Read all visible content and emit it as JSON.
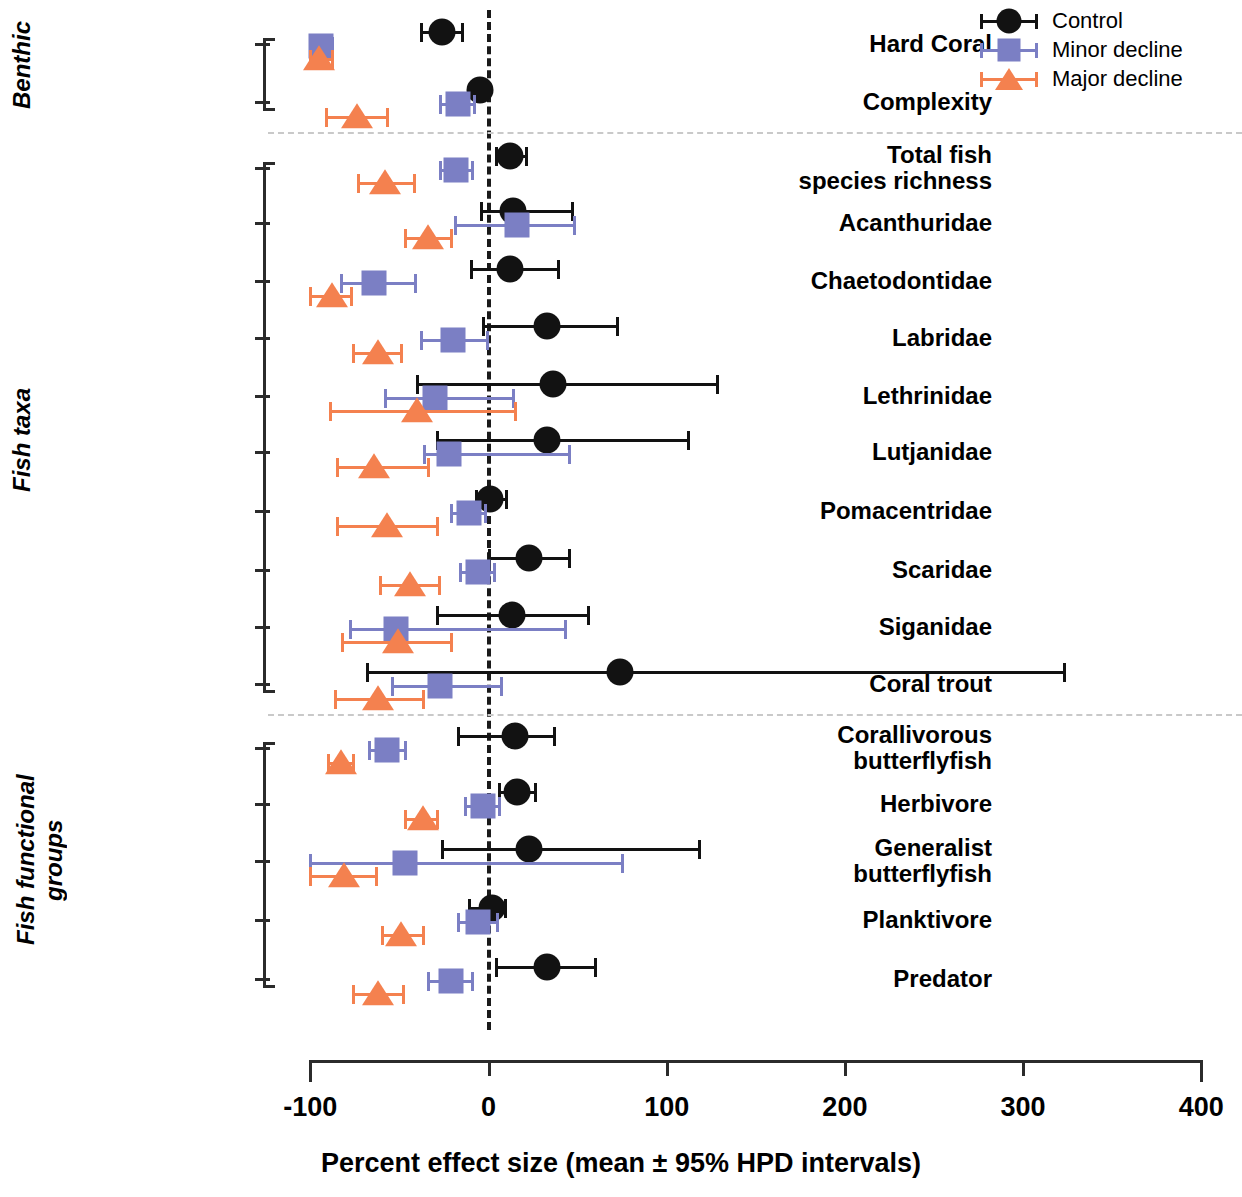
{
  "legend": {
    "items": [
      {
        "label": "Control",
        "marker": "circle",
        "color": "#121212"
      },
      {
        "label": "Minor decline",
        "marker": "square",
        "color": "#7b7fc4"
      },
      {
        "label": "Major decline",
        "marker": "triangle",
        "color": "#f4814f"
      }
    ]
  },
  "axis": {
    "xlabel": "Percent effect size (mean ± 95% HPD intervals)",
    "xticks": [
      "-100",
      "0",
      "100",
      "200",
      "300",
      "400"
    ]
  },
  "groups": [
    {
      "label": "Benthic"
    },
    {
      "label": "Fish taxa"
    },
    {
      "label": "Fish functional\ngroups"
    }
  ],
  "rows": [
    {
      "label": "Hard Coral"
    },
    {
      "label": "Complexity"
    },
    {
      "label": "Total fish\nspecies richness"
    },
    {
      "label": "Acanthuridae"
    },
    {
      "label": "Chaetodontidae"
    },
    {
      "label": "Labridae"
    },
    {
      "label": "Lethrinidae"
    },
    {
      "label": "Lutjanidae"
    },
    {
      "label": "Pomacentridae"
    },
    {
      "label": "Scaridae"
    },
    {
      "label": "Siganidae"
    },
    {
      "label": "Coral trout"
    },
    {
      "label": "Corallivorous\nbutterflyfish"
    },
    {
      "label": "Herbivore"
    },
    {
      "label": "Generalist\nbutterflyfish"
    },
    {
      "label": "Planktivore"
    },
    {
      "label": "Predator"
    }
  ],
  "chart_data": {
    "type": "scatter",
    "subtype": "forest-plot",
    "title": "",
    "xlabel": "Percent effect size (mean ± 95% HPD intervals)",
    "ylabel": "",
    "xlim": [
      -100,
      400
    ],
    "xticks": [
      -100,
      0,
      100,
      200,
      300,
      400
    ],
    "grid": false,
    "reference_line": 0,
    "legend_position": "top-right",
    "categories": [
      "Hard Coral",
      "Complexity",
      "Total fish species richness",
      "Acanthuridae",
      "Chaetodontidae",
      "Labridae",
      "Lethrinidae",
      "Lutjanidae",
      "Pomacentridae",
      "Scaridae",
      "Siganidae",
      "Coral trout",
      "Corallivorous butterflyfish",
      "Herbivore",
      "Generalist butterflyfish",
      "Planktivore",
      "Predator"
    ],
    "category_groups": [
      {
        "name": "Benthic",
        "categories": [
          "Hard Coral",
          "Complexity"
        ]
      },
      {
        "name": "Fish taxa",
        "categories": [
          "Total fish species richness",
          "Acanthuridae",
          "Chaetodontidae",
          "Labridae",
          "Lethrinidae",
          "Lutjanidae",
          "Pomacentridae",
          "Scaridae",
          "Siganidae",
          "Coral trout"
        ]
      },
      {
        "name": "Fish functional groups",
        "categories": [
          "Corallivorous butterflyfish",
          "Herbivore",
          "Generalist butterflyfish",
          "Planktivore",
          "Predator"
        ]
      }
    ],
    "series": [
      {
        "name": "Control",
        "marker": "circle",
        "color": "#121212",
        "values": [
          -26,
          -5,
          12,
          14,
          12,
          33,
          36,
          33,
          1,
          23,
          13,
          74,
          15,
          16,
          23,
          2,
          33
        ],
        "ci_lower": [
          -38,
          -9,
          4,
          -4,
          -10,
          -3,
          -40,
          -29,
          -7,
          0,
          -29,
          -68,
          -17,
          6,
          -26,
          -11,
          4
        ],
        "ci_upper": [
          -15,
          -2,
          21,
          47,
          39,
          72,
          128,
          112,
          10,
          45,
          56,
          323,
          37,
          26,
          118,
          9,
          60
        ]
      },
      {
        "name": "Minor decline",
        "marker": "square",
        "color": "#7b7fc4",
        "values": [
          -94,
          -17,
          -18,
          16,
          -64,
          -20,
          -30,
          -22,
          -11,
          -6,
          -52,
          -27,
          -57,
          -3,
          -47,
          -6,
          -21
        ],
        "ci_lower": [
          -100,
          -27,
          -27,
          -19,
          -83,
          -38,
          -58,
          -36,
          -21,
          -16,
          -78,
          -54,
          -67,
          -13,
          -100,
          -17,
          -34
        ],
        "ci_upper": [
          -88,
          -8,
          -9,
          48,
          -41,
          -1,
          14,
          45,
          -2,
          3,
          43,
          7,
          -47,
          6,
          75,
          5,
          -9
        ]
      },
      {
        "name": "Major decline",
        "marker": "triangle",
        "color": "#f4814f",
        "values": [
          -95,
          -74,
          -58,
          -34,
          -88,
          -62,
          -40,
          -64,
          -57,
          -44,
          -51,
          -62,
          -83,
          -37,
          -81,
          -49,
          -62
        ],
        "ci_lower": [
          -100,
          -91,
          -73,
          -47,
          -100,
          -76,
          -89,
          -85,
          -85,
          -61,
          -82,
          -86,
          -90,
          -47,
          -100,
          -60,
          -76
        ],
        "ci_upper": [
          -88,
          -57,
          -42,
          -21,
          -77,
          -49,
          15,
          -34,
          -29,
          -28,
          -21,
          -37,
          -76,
          -29,
          -63,
          -37,
          -48
        ]
      }
    ]
  }
}
